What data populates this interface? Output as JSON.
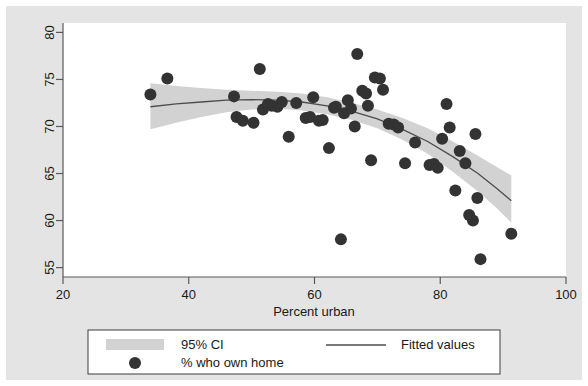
{
  "chart_data": {
    "type": "scatter",
    "title": "",
    "xlabel": "Percent urban",
    "ylabel": "",
    "xlim": [
      20,
      100
    ],
    "ylim": [
      54,
      81
    ],
    "xticks": [
      20,
      40,
      60,
      80,
      100
    ],
    "yticks": [
      55,
      60,
      65,
      70,
      75,
      80
    ],
    "grid": false,
    "legend_position": "bottom",
    "series": [
      {
        "name": "% who own home",
        "type": "scatter",
        "marker": "circle",
        "color": "#333333",
        "points": [
          [
            33.9,
            73.4
          ],
          [
            36.6,
            75.1
          ],
          [
            47.2,
            73.2
          ],
          [
            47.6,
            71.0
          ],
          [
            48.6,
            70.6
          ],
          [
            50.3,
            70.4
          ],
          [
            51.3,
            76.1
          ],
          [
            51.8,
            71.8
          ],
          [
            52.6,
            72.4
          ],
          [
            53.2,
            72.2
          ],
          [
            54.1,
            72.1
          ],
          [
            54.8,
            72.6
          ],
          [
            55.9,
            68.9
          ],
          [
            57.1,
            72.5
          ],
          [
            58.6,
            70.9
          ],
          [
            59.3,
            71.0
          ],
          [
            59.8,
            73.1
          ],
          [
            60.7,
            70.6
          ],
          [
            61.3,
            70.7
          ],
          [
            62.3,
            67.7
          ],
          [
            63.1,
            72.0
          ],
          [
            63.4,
            72.1
          ],
          [
            64.2,
            58.0
          ],
          [
            64.7,
            71.4
          ],
          [
            65.3,
            72.8
          ],
          [
            65.8,
            71.9
          ],
          [
            66.4,
            70.0
          ],
          [
            66.8,
            77.7
          ],
          [
            67.6,
            73.8
          ],
          [
            68.2,
            73.5
          ],
          [
            68.5,
            72.2
          ],
          [
            69.0,
            66.4
          ],
          [
            69.6,
            75.2
          ],
          [
            70.4,
            75.1
          ],
          [
            70.9,
            73.9
          ],
          [
            71.8,
            70.3
          ],
          [
            72.6,
            70.2
          ],
          [
            73.3,
            69.9
          ],
          [
            74.4,
            66.1
          ],
          [
            76.0,
            68.3
          ],
          [
            78.3,
            65.9
          ],
          [
            79.0,
            66.0
          ],
          [
            79.6,
            65.6
          ],
          [
            80.3,
            68.7
          ],
          [
            81.0,
            72.4
          ],
          [
            81.5,
            69.9
          ],
          [
            82.4,
            63.2
          ],
          [
            83.1,
            67.4
          ],
          [
            84.0,
            66.1
          ],
          [
            84.6,
            60.6
          ],
          [
            85.2,
            60.0
          ],
          [
            85.6,
            69.2
          ],
          [
            85.9,
            62.4
          ],
          [
            86.4,
            55.9
          ],
          [
            91.3,
            58.6
          ]
        ]
      },
      {
        "name": "Fitted values",
        "type": "line",
        "color": "#4d4d4d",
        "points": [
          [
            33.9,
            72.1
          ],
          [
            38.0,
            72.4
          ],
          [
            42.0,
            72.6
          ],
          [
            46.0,
            72.8
          ],
          [
            50.0,
            72.85
          ],
          [
            54.0,
            72.8
          ],
          [
            58.0,
            72.6
          ],
          [
            62.0,
            72.2
          ],
          [
            66.0,
            71.6
          ],
          [
            70.0,
            70.8
          ],
          [
            74.0,
            69.7
          ],
          [
            78.0,
            68.4
          ],
          [
            82.0,
            66.8
          ],
          [
            86.0,
            65.0
          ],
          [
            89.0,
            63.4
          ],
          [
            91.3,
            62.1
          ]
        ]
      },
      {
        "name": "95% CI",
        "type": "band",
        "color": "#d2d2d2",
        "upper": [
          [
            33.9,
            74.6
          ],
          [
            38.0,
            74.3
          ],
          [
            42.0,
            74.1
          ],
          [
            46.0,
            73.9
          ],
          [
            50.0,
            73.8
          ],
          [
            54.0,
            73.7
          ],
          [
            58.0,
            73.5
          ],
          [
            62.0,
            73.1
          ],
          [
            66.0,
            72.5
          ],
          [
            70.0,
            71.8
          ],
          [
            74.0,
            70.9
          ],
          [
            78.0,
            69.8
          ],
          [
            82.0,
            68.4
          ],
          [
            86.0,
            66.9
          ],
          [
            89.0,
            65.7
          ],
          [
            91.3,
            64.8
          ]
        ],
        "lower": [
          [
            33.9,
            69.7
          ],
          [
            38.0,
            70.4
          ],
          [
            42.0,
            71.0
          ],
          [
            46.0,
            71.5
          ],
          [
            50.0,
            71.8
          ],
          [
            54.0,
            71.9
          ],
          [
            58.0,
            71.7
          ],
          [
            62.0,
            71.3
          ],
          [
            66.0,
            70.7
          ],
          [
            70.0,
            69.8
          ],
          [
            74.0,
            68.6
          ],
          [
            78.0,
            67.1
          ],
          [
            82.0,
            65.2
          ],
          [
            86.0,
            63.1
          ],
          [
            89.0,
            61.3
          ],
          [
            91.3,
            59.8
          ]
        ]
      }
    ],
    "legend": [
      {
        "label": "95% CI",
        "marker": "band",
        "color": "#d2d2d2"
      },
      {
        "label": "Fitted values",
        "marker": "line",
        "color": "#4d4d4d"
      },
      {
        "label": "% who own home",
        "marker": "circle",
        "color": "#333333"
      }
    ]
  },
  "axis": {
    "x_title": "Percent urban",
    "x_tick_labels": [
      "20",
      "40",
      "60",
      "80",
      "100"
    ],
    "y_tick_labels": [
      "55",
      "60",
      "65",
      "70",
      "75",
      "80"
    ]
  },
  "legend": {
    "ci_label": "95% CI",
    "fitted_label": "Fitted values",
    "points_label": "% who own home"
  },
  "colors": {
    "panel_background": "#e4e4e4",
    "plot_background": "#ffffff",
    "band": "#d2d2d2",
    "fit_line": "#4d4d4d",
    "marker": "#333333",
    "axis": "#5a5a5a",
    "text": "#1a1a1a"
  }
}
